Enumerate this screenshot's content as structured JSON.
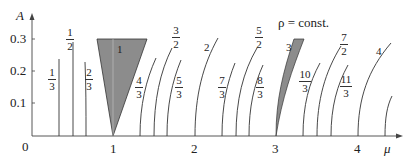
{
  "figure": {
    "annotation": "ρ = const.",
    "y_axis": {
      "label": "A",
      "ticks": [
        "0.3",
        "0.2",
        "0.1"
      ]
    },
    "x_axis": {
      "label": "μ",
      "origin": "0",
      "ticks": [
        "1",
        "2",
        "3",
        "4"
      ]
    },
    "tongues": [
      {
        "label_num": "1",
        "label_den": "3"
      },
      {
        "label_num": "1",
        "label_den": "2"
      },
      {
        "label_num": "2",
        "label_den": "3"
      },
      {
        "label": "1",
        "shaded": true
      },
      {
        "label_num": "4",
        "label_den": "3"
      },
      {
        "label_num": "3",
        "label_den": "2"
      },
      {
        "label_num": "5",
        "label_den": "3"
      },
      {
        "label": "2"
      },
      {
        "label_num": "7",
        "label_den": "3"
      },
      {
        "label_num": "5",
        "label_den": "2"
      },
      {
        "label_num": "8",
        "label_den": "3"
      },
      {
        "label": "3",
        "shaded": true
      },
      {
        "label_num": "10",
        "label_den": "3"
      },
      {
        "label_num": "7",
        "label_den": "2"
      },
      {
        "label_num": "11",
        "label_den": "3"
      },
      {
        "label": "4"
      }
    ],
    "colors": {
      "line": "#333333",
      "shade": "#8c8c8c",
      "background": "#ffffff"
    }
  }
}
